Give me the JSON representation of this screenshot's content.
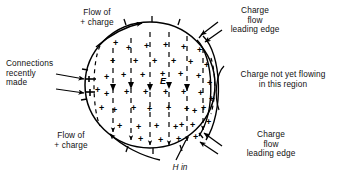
{
  "figure": {
    "background_color": "#ffffff",
    "ink_color": "#000000",
    "width": 346,
    "height": 185
  },
  "labels": {
    "flow_top": "Flow of\n+ charge",
    "connections": "Connections\nrecently\nmade",
    "flow_bottom": "Flow of\n+ charge",
    "charge_leading_top": "Charge\nflow\nleading edge",
    "charge_not_flowing": "Charge not yet flowing\nin this region",
    "charge_leading_bottom": "Charge\nflow\nleading edge",
    "h_in": "H in",
    "e_field": "E"
  },
  "symbols": {
    "plus_sign": "+",
    "plus_count": 46,
    "plus_positions": [
      [
        104,
        73
      ],
      [
        104,
        90
      ],
      [
        110,
        57
      ],
      [
        112,
        106
      ],
      [
        117,
        122
      ],
      [
        121,
        71
      ],
      [
        124,
        88
      ],
      [
        126,
        44
      ],
      [
        131,
        104
      ],
      [
        133,
        57
      ],
      [
        136,
        123
      ],
      [
        138,
        135
      ],
      [
        140,
        71
      ],
      [
        143,
        88
      ],
      [
        144,
        42
      ],
      [
        147,
        105
      ],
      [
        152,
        57
      ],
      [
        154,
        122
      ],
      [
        158,
        136
      ],
      [
        160,
        70
      ],
      [
        163,
        88
      ],
      [
        163,
        41
      ],
      [
        166,
        104
      ],
      [
        171,
        57
      ],
      [
        173,
        123
      ],
      [
        176,
        135
      ],
      [
        178,
        70
      ],
      [
        181,
        88
      ],
      [
        181,
        43
      ],
      [
        184,
        105
      ],
      [
        188,
        58
      ],
      [
        190,
        121
      ],
      [
        193,
        133
      ],
      [
        196,
        72
      ],
      [
        198,
        89
      ],
      [
        197,
        46
      ],
      [
        201,
        104
      ],
      [
        204,
        61
      ],
      [
        206,
        118
      ],
      [
        207,
        79
      ],
      [
        209,
        95
      ],
      [
        95,
        86
      ],
      [
        99,
        104
      ],
      [
        113,
        39
      ],
      [
        179,
        121
      ],
      [
        192,
        107
      ]
    ],
    "field_line_arrow": "downward-arrowhead",
    "field_line_count": 6
  },
  "geometry": {
    "plate_circle": {
      "cx": 150,
      "cy": 85,
      "rx": 65,
      "ry": 63
    },
    "dashed_boundary_note": "dashed arcs inside plate mark charge-flow leading edge",
    "terminal_count": 2
  },
  "icons": {
    "arrow": "arrow-icon",
    "terminal": "terminal-plate-icon",
    "field_arrow": "e-field-arrow-icon"
  }
}
